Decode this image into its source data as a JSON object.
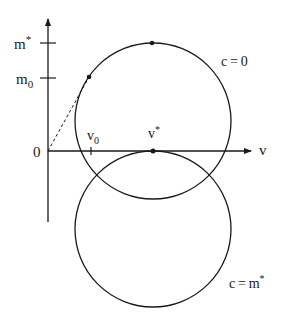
{
  "diagram": {
    "axes": {
      "horizontal_label": "v",
      "origin_label": "0",
      "vertical_ticks": [
        {
          "label": "m*",
          "base": "m",
          "sup": "*"
        },
        {
          "label": "m0",
          "base": "m",
          "sub": "0"
        }
      ],
      "horizontal_ticks": [
        {
          "label": "v0",
          "base": "v",
          "sub": "0"
        },
        {
          "label": "v*",
          "base": "v",
          "sup": "*"
        }
      ]
    },
    "circles": [
      {
        "label": "c=0",
        "text": "c = 0"
      },
      {
        "label": "c=m*",
        "text": "c = m",
        "sup": "*"
      }
    ],
    "colors": {
      "stroke": "#1a1a1a",
      "background": "#ffffff"
    }
  }
}
